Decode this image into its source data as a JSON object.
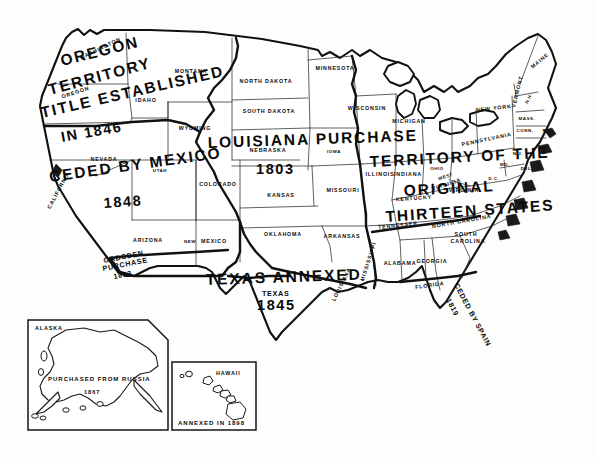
{
  "document": {
    "title": "Territorial Growth of the United States",
    "type": "historical-map",
    "background_color": "#fdfdfc",
    "ink_color": "#111111"
  },
  "acquisitions": [
    {
      "id": "oregon",
      "lines": [
        "OREGON",
        "TERRITORY",
        "TITLE ESTABLISHED",
        "IN 1846"
      ],
      "year": "1846",
      "line1": "OREGON",
      "line2": "TERRITORY",
      "line3": "TITLE ESTABLISHED",
      "line4": "IN 1846"
    },
    {
      "id": "mexican-cession",
      "line1": "CEDED BY MEXICO",
      "year": "1848"
    },
    {
      "id": "gadsden",
      "line1": "GADSDEN",
      "line2": "PURCHASE",
      "year": "1853"
    },
    {
      "id": "louisiana",
      "line1": "LOUISIANA PURCHASE",
      "year": "1803"
    },
    {
      "id": "texas",
      "line1": "TEXAS  ANNEXED",
      "sub": "TEXAS",
      "year": "1845"
    },
    {
      "id": "thirteen-states",
      "line1": "TERRITORY OF THE",
      "line2": "ORIGINAL",
      "line3": "THIRTEEN STATES"
    },
    {
      "id": "florida",
      "line1": "CEDED BY SPAIN",
      "year": "1819"
    }
  ],
  "states": [
    {
      "name": "WASHINGTON",
      "x": 101,
      "y": 50,
      "rot": -26
    },
    {
      "name": "OREGON",
      "x": 76,
      "y": 94,
      "rot": -18
    },
    {
      "name": "IDAHO",
      "x": 146,
      "y": 102,
      "rot": 0
    },
    {
      "name": "MONTANA",
      "x": 191,
      "y": 73,
      "rot": 0
    },
    {
      "name": "WYOMING",
      "x": 195,
      "y": 130,
      "rot": 0
    },
    {
      "name": "NEVADA",
      "x": 104,
      "y": 161,
      "rot": 0
    },
    {
      "name": "UTAH",
      "x": 160,
      "y": 172,
      "rot": 0
    },
    {
      "name": "CALIFORNIA",
      "x": 60,
      "y": 191,
      "rot": -62
    },
    {
      "name": "COLORADO",
      "x": 218,
      "y": 186,
      "rot": 0
    },
    {
      "name": "ARIZONA",
      "x": 148,
      "y": 242,
      "rot": 0
    },
    {
      "name": "NEW",
      "x": 190,
      "y": 243,
      "rot": 0
    },
    {
      "name": "MEXICO",
      "x": 214,
      "y": 243,
      "rot": 0
    },
    {
      "name": "NORTH DAKOTA",
      "x": 266,
      "y": 83,
      "rot": 0
    },
    {
      "name": "SOUTH DAKOTA",
      "x": 269,
      "y": 113,
      "rot": 0
    },
    {
      "name": "MINNESOTA",
      "x": 335,
      "y": 70,
      "rot": 0
    },
    {
      "name": "NEBRASKA",
      "x": 268,
      "y": 152,
      "rot": 0
    },
    {
      "name": "IOWA",
      "x": 334,
      "y": 153,
      "rot": 0
    },
    {
      "name": "WISCONSIN",
      "x": 367,
      "y": 110,
      "rot": 0
    },
    {
      "name": "MICHIGAN",
      "x": 409,
      "y": 123,
      "rot": 0
    },
    {
      "name": "KANSAS",
      "x": 281,
      "y": 197,
      "rot": 0
    },
    {
      "name": "MISSOURI",
      "x": 343,
      "y": 192,
      "rot": 0
    },
    {
      "name": "ILLINOIS",
      "x": 380,
      "y": 176,
      "rot": 0
    },
    {
      "name": "INDIANA",
      "x": 408,
      "y": 176,
      "rot": 0
    },
    {
      "name": "OHIO",
      "x": 437,
      "y": 170,
      "rot": 0
    },
    {
      "name": "OKLAHOMA",
      "x": 283,
      "y": 236,
      "rot": 0
    },
    {
      "name": "ARKANSAS",
      "x": 342,
      "y": 238,
      "rot": 0
    },
    {
      "name": "TENNESSEE",
      "x": 398,
      "y": 227,
      "rot": -6
    },
    {
      "name": "KENTUCKY",
      "x": 414,
      "y": 200,
      "rot": -4
    },
    {
      "name": "MISSISSIPPI",
      "x": 370,
      "y": 262,
      "rot": -72
    },
    {
      "name": "ALABAMA",
      "x": 400,
      "y": 265,
      "rot": 0
    },
    {
      "name": "GEORGIA",
      "x": 432,
      "y": 263,
      "rot": 0
    },
    {
      "name": "LOUISIANA",
      "x": 343,
      "y": 285,
      "rot": -64
    },
    {
      "name": "FLORIDA",
      "x": 430,
      "y": 287,
      "rot": -8
    },
    {
      "name": "NORTH CAROLINA",
      "x": 462,
      "y": 223,
      "rot": -10
    },
    {
      "name": "SOUTH",
      "x": 466,
      "y": 236,
      "rot": 0
    },
    {
      "name": "CAROLINA",
      "x": 468,
      "y": 243,
      "rot": 0
    },
    {
      "name": "VIRGINIA",
      "x": 464,
      "y": 192,
      "rot": 0
    },
    {
      "name": "WEST",
      "x": 446,
      "y": 178,
      "rot": -18
    },
    {
      "name": "VIRGINIA",
      "x": 447,
      "y": 186,
      "rot": -18
    },
    {
      "name": "PENNSYLVANIA",
      "x": 487,
      "y": 141,
      "rot": -12
    },
    {
      "name": "NEW YORK",
      "x": 494,
      "y": 110,
      "rot": -6
    },
    {
      "name": "MAINE",
      "x": 541,
      "y": 62,
      "rot": -40
    },
    {
      "name": "VERMONT",
      "x": 519,
      "y": 92,
      "rot": -76
    },
    {
      "name": "N.H.",
      "x": 530,
      "y": 99,
      "rot": -66
    },
    {
      "name": "MASS.",
      "x": 527,
      "y": 120,
      "rot": 0
    },
    {
      "name": "CONN.",
      "x": 525,
      "y": 132,
      "rot": 0
    },
    {
      "name": "R.I.",
      "x": 547,
      "y": 132,
      "rot": 0
    },
    {
      "name": "N.J.",
      "x": 518,
      "y": 155,
      "rot": 0
    },
    {
      "name": "MD.",
      "x": 505,
      "y": 166,
      "rot": 0
    },
    {
      "name": "DEL.",
      "x": 527,
      "y": 170,
      "rot": 0
    },
    {
      "name": "D.C.",
      "x": 494,
      "y": 180,
      "rot": 0
    }
  ],
  "insets": [
    {
      "id": "alaska",
      "title": "ALASKA",
      "caption": "PURCHASED FROM RUSSIA",
      "year": "1867"
    },
    {
      "id": "hawaii",
      "title": "HAWAII",
      "caption": "ANNEXED IN 1898"
    }
  ]
}
